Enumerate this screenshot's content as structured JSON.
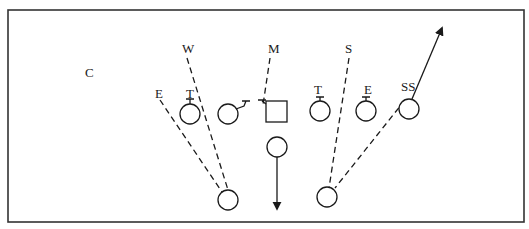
{
  "diagram": {
    "type": "football-defensive-play",
    "labels": {
      "coverage": "C",
      "w": "W",
      "m": "M",
      "s": "S",
      "e_left": "E",
      "t_left": "T",
      "t_right": "T",
      "e_right": "E",
      "ss": "SS"
    },
    "players": {
      "left_end": "E",
      "left_tackle": "T",
      "left_guard": "G",
      "center": "C",
      "right_tackle": "T",
      "right_end": "E",
      "strong_safety": "SS",
      "back_left": "B",
      "back_right": "B",
      "fullback": "FB"
    },
    "colors": {
      "line": "#1a1a1a",
      "background": "#ffffff"
    }
  }
}
